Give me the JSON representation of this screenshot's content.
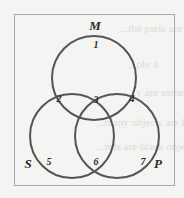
{
  "diagram": {
    "type": "venn-3",
    "colors": {
      "circle_stroke": "#555555",
      "frame_stroke": "#a8a8a8",
      "text": "#2b2b2b",
      "background": "#f4f4f2"
    },
    "sets": [
      {
        "id": "M",
        "label": "M"
      },
      {
        "id": "S",
        "label": "S"
      },
      {
        "id": "P",
        "label": "P"
      }
    ],
    "regions": [
      {
        "label": "1",
        "in": [
          "M"
        ]
      },
      {
        "label": "2",
        "in": [
          "M",
          "S"
        ]
      },
      {
        "label": "3",
        "in": [
          "M",
          "S",
          "P"
        ]
      },
      {
        "label": "4",
        "in": [
          "M",
          "P"
        ]
      },
      {
        "label": "5",
        "in": [
          "S"
        ]
      },
      {
        "label": "6",
        "in": [
          "S",
          "P"
        ]
      },
      {
        "label": "7",
        "in": [
          "P"
        ]
      }
    ]
  },
  "background_text": [
    "...the parts are not present",
    "...ple 4",
    "...y are sometimes",
    "...many objects are black objects",
    "...irds are black objects",
    "...ng are s...",
    "...Chatter..."
  ]
}
